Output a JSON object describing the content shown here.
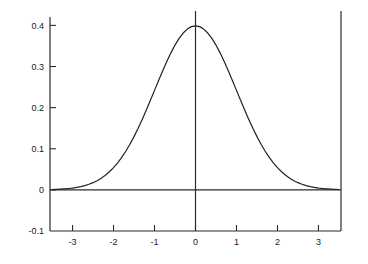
{
  "chart_data": {
    "type": "line",
    "title": "",
    "subtitle": "",
    "xlabel": "",
    "ylabel": "",
    "xlim": [
      -3.55,
      3.55
    ],
    "ylim": [
      -0.1,
      0.435
    ],
    "grid": false,
    "legend": null,
    "annotations": [],
    "axis_lines": {
      "zero_horizontal": 0,
      "zero_vertical": 0
    },
    "xticks": [
      -3,
      -2,
      -1,
      0,
      1,
      2,
      3
    ],
    "xtick_labels": [
      "-3",
      "-2",
      "-1",
      "0",
      "1",
      "2",
      "3"
    ],
    "yticks": [
      -0.1,
      0,
      0.1,
      0.2,
      0.3,
      0.4
    ],
    "ytick_labels": [
      "-0.1",
      "0",
      "0.1",
      "0.2",
      "0.3",
      "0.4"
    ],
    "series": [
      {
        "name": "standard normal pdf",
        "color": "#222222",
        "x": [
          -3.5,
          -3.4,
          -3.3,
          -3.2,
          -3.1,
          -3.0,
          -2.9,
          -2.8,
          -2.7,
          -2.6,
          -2.5,
          -2.4,
          -2.3,
          -2.2,
          -2.1,
          -2.0,
          -1.9,
          -1.8,
          -1.7,
          -1.6,
          -1.5,
          -1.4,
          -1.3,
          -1.2,
          -1.1,
          -1.0,
          -0.9,
          -0.8,
          -0.7,
          -0.6,
          -0.5,
          -0.4,
          -0.3,
          -0.2,
          -0.1,
          0.0,
          0.1,
          0.2,
          0.3,
          0.4,
          0.5,
          0.6,
          0.7,
          0.8,
          0.9,
          1.0,
          1.1,
          1.2,
          1.3,
          1.4,
          1.5,
          1.6,
          1.7,
          1.8,
          1.9,
          2.0,
          2.1,
          2.2,
          2.3,
          2.4,
          2.5,
          2.6,
          2.7,
          2.8,
          2.9,
          3.0,
          3.1,
          3.2,
          3.3,
          3.4,
          3.5
        ],
        "y": [
          0.0009,
          0.0012,
          0.0017,
          0.0024,
          0.0033,
          0.0044,
          0.006,
          0.0079,
          0.0104,
          0.0136,
          0.0175,
          0.0224,
          0.0283,
          0.0355,
          0.044,
          0.054,
          0.0656,
          0.079,
          0.094,
          0.1109,
          0.1295,
          0.1497,
          0.1714,
          0.1942,
          0.2179,
          0.242,
          0.2661,
          0.2897,
          0.3123,
          0.3332,
          0.3521,
          0.3683,
          0.3814,
          0.391,
          0.397,
          0.3989,
          0.397,
          0.391,
          0.3814,
          0.3683,
          0.3521,
          0.3332,
          0.3123,
          0.2897,
          0.2661,
          0.242,
          0.2179,
          0.1942,
          0.1714,
          0.1497,
          0.1295,
          0.1109,
          0.094,
          0.079,
          0.0656,
          0.054,
          0.044,
          0.0355,
          0.0283,
          0.0224,
          0.0175,
          0.0136,
          0.0104,
          0.0079,
          0.006,
          0.0044,
          0.0033,
          0.0024,
          0.0017,
          0.0012,
          0.0009
        ],
        "peak_x": 0,
        "peak_y": 0.3989
      }
    ]
  }
}
